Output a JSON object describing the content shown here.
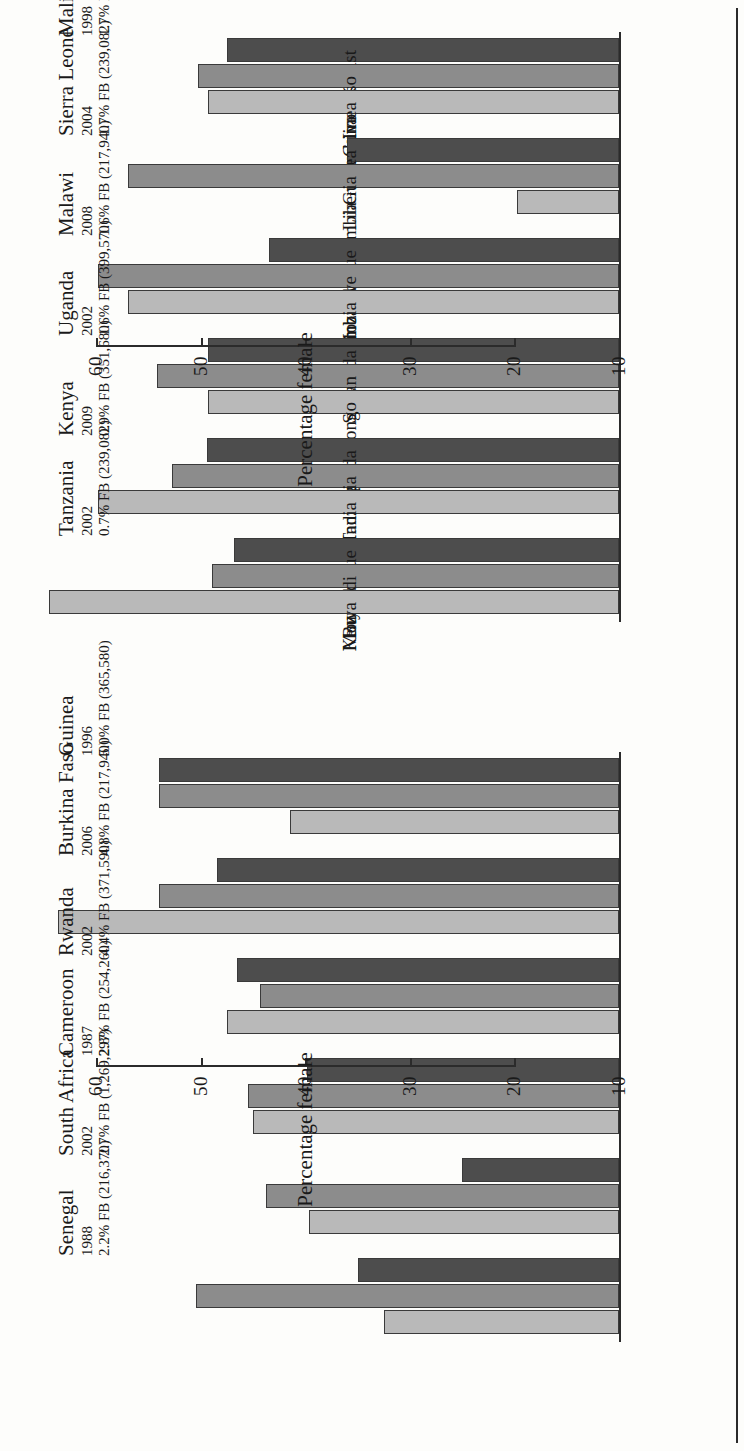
{
  "figure": {
    "orientation": "rotated-90-clockwise",
    "axis_title": "Percentage female",
    "tick_labels": [
      "10",
      "20",
      "30",
      "40",
      "50",
      "60"
    ],
    "axis_min": 10,
    "axis_max": 65,
    "colors": {
      "series_1": "#4d4d4d",
      "series_2": "#8c8c8c",
      "series_3": "#b9b9b9",
      "axis": "#2b2b2b",
      "page": "#fdfdfb"
    }
  },
  "chart_data": [
    {
      "type": "bar",
      "panel": "upper",
      "title": "",
      "xlabel": "",
      "ylabel": "Percentage female",
      "ylim": [
        10,
        65
      ],
      "grid": false,
      "legend": "none",
      "tick_labels": [
        "10",
        "20",
        "30",
        "40",
        "50",
        "60"
      ],
      "groups": [
        {
          "country": "Mali",
          "year": "1998",
          "fb": "1.7% FB (166,860)",
          "categories": [
            "Ivory Coast",
            "Burkina Faso",
            "Guinea"
          ],
          "values": [
            47.5,
            50.3,
            49.3
          ]
        },
        {
          "country": "Sierra Leone",
          "year": "2004",
          "fb": "1.7% FB (239,082)",
          "categories": [
            "Guinea",
            "Liberia",
            "Gambia"
          ],
          "values": [
            36.0,
            57.0,
            19.8
          ]
        },
        {
          "country": "Malawi",
          "year": "2008",
          "fb": "1.6% FB (217,940)",
          "categories": [
            "Mozambique",
            "Zimbabwe",
            "Zambia"
          ],
          "values": [
            43.5,
            59.8,
            57.0
          ]
        },
        {
          "country": "Uganda",
          "year": "2002",
          "fb": "1.6% FB (399,570)",
          "categories": [
            "Rwanda",
            "Sudan",
            "Rep. of Congo"
          ],
          "values": [
            49.3,
            54.2,
            49.3
          ]
        },
        {
          "country": "Kenya",
          "year": "2009",
          "fb": "0.9% FB (351,680)",
          "categories": [
            "Uganda",
            "Tanzania",
            "India"
          ],
          "values": [
            49.4,
            52.8,
            59.8
          ]
        },
        {
          "country": "Tanzania",
          "year": "2002",
          "fb": "0.7% FB (239,082)",
          "categories": [
            "Mozambique",
            "Burundi",
            "Kenya"
          ],
          "values": [
            46.8,
            48.9,
            64.5
          ]
        }
      ]
    },
    {
      "type": "bar",
      "panel": "lower",
      "title": "",
      "xlabel": "",
      "ylabel": "Percentage female",
      "ylim": [
        10,
        65
      ],
      "grid": false,
      "legend": "none",
      "tick_labels": [
        "10",
        "20",
        "30",
        "40",
        "50",
        "60"
      ],
      "groups": [
        {
          "country": "Guinea",
          "year": "1996",
          "fb": "5.0% FB (365,580)",
          "categories": [
            "Liberia",
            "Sierra Leone",
            "Mali"
          ],
          "values": [
            54.0,
            54.0,
            41.5
          ]
        },
        {
          "country": "Burkina Faso",
          "year": "2006",
          "fb": "4.8% FB (217,940)",
          "categories": [
            "Ivory Coast",
            "Mali",
            "Ghana"
          ],
          "values": [
            48.5,
            54.0,
            63.7
          ]
        },
        {
          "country": "Rwanda",
          "year": "2002",
          "fb": "4.4% FB (371,590)",
          "categories": [
            "Rep. of Congo",
            "Uganda",
            "Burundi"
          ],
          "values": [
            46.5,
            44.3,
            47.5
          ]
        },
        {
          "country": "Cameroon",
          "year": "1987",
          "fb": "2.8% FB (254,260)",
          "categories": [
            "Nigeria",
            "Chad",
            "C African Rep."
          ],
          "values": [
            39.8,
            45.5,
            45.0
          ]
        },
        {
          "country": "South Africa",
          "year": "2002",
          "fb": "2.7% FB (1,269,297)",
          "categories": [
            "Mozambique",
            "U.K.",
            "Zimbabwe"
          ],
          "values": [
            25.0,
            43.8,
            39.7
          ]
        },
        {
          "country": "Senegal",
          "year": "1988",
          "fb": "2.2% FB (216,370)",
          "categories": [
            "Guinea",
            "Cape Verde",
            "Mauritania"
          ],
          "values": [
            35.0,
            50.5,
            32.5
          ]
        }
      ]
    }
  ]
}
